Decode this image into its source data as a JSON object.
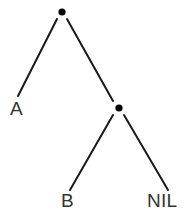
{
  "figure": {
    "background_color": "#ffffff",
    "line_color": "#1a1a1a",
    "dot_color": "#000000",
    "label_color": "#333333"
  },
  "nodes": [
    {
      "id": "root",
      "type": "dot",
      "label": "",
      "x": 62,
      "y": 12
    },
    {
      "id": "inner",
      "type": "dot",
      "label": "",
      "x": 119,
      "y": 108
    },
    {
      "id": "a",
      "type": "label",
      "label": "A",
      "x": 17,
      "y": 108
    },
    {
      "id": "b",
      "type": "label",
      "label": "B",
      "x": 68,
      "y": 200
    },
    {
      "id": "nil",
      "type": "label",
      "label": "NIL",
      "x": 166,
      "y": 200
    }
  ],
  "edges": [
    {
      "id": "root-to-a",
      "from": "root",
      "to": "a",
      "x1": 57,
      "y1": 19,
      "x2": 18,
      "y2": 96
    },
    {
      "id": "root-to-inner",
      "from": "root",
      "to": "inner",
      "x1": 67,
      "y1": 19,
      "x2": 113,
      "y2": 101
    },
    {
      "id": "inner-to-b",
      "from": "inner",
      "to": "b",
      "x1": 113,
      "y1": 115,
      "x2": 70,
      "y2": 190
    },
    {
      "id": "inner-to-nil",
      "from": "inner",
      "to": "nil",
      "x1": 124,
      "y1": 115,
      "x2": 168,
      "y2": 190
    }
  ],
  "labels": {
    "a": "A",
    "b": "B",
    "nil": "NIL"
  }
}
